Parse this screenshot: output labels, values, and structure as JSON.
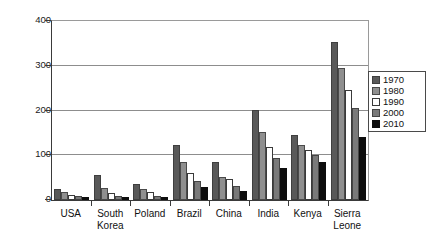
{
  "chart_data": {
    "type": "bar",
    "title": "",
    "xlabel": "",
    "ylabel": "",
    "ylim": [
      0,
      400
    ],
    "yticks": [
      0,
      100,
      200,
      300,
      400
    ],
    "grid": true,
    "legend_position": "right",
    "categories": [
      "USA",
      "South\nKorea",
      "Poland",
      "Brazil",
      "China",
      "India",
      "Kenya",
      "Sierra\nLeone"
    ],
    "series": [
      {
        "name": "1970",
        "color": "#595959",
        "values": [
          25,
          55,
          35,
          122,
          85,
          202,
          145,
          352
        ]
      },
      {
        "name": "1980",
        "color": "#8f8f8f",
        "values": [
          17,
          27,
          25,
          85,
          52,
          152,
          122,
          295
        ]
      },
      {
        "name": "1990",
        "color": "#ffffff",
        "values": [
          12,
          15,
          18,
          60,
          48,
          118,
          112,
          245
        ]
      },
      {
        "name": "2000",
        "color": "#7a7a7a",
        "values": [
          9,
          10,
          10,
          42,
          32,
          95,
          100,
          205
        ]
      },
      {
        "name": "2010",
        "color": "#0d0d0d",
        "values": [
          7,
          6,
          6,
          30,
          20,
          72,
          85,
          140
        ]
      }
    ]
  },
  "legend": {
    "items": [
      {
        "label": "1970"
      },
      {
        "label": "1980"
      },
      {
        "label": "1990"
      },
      {
        "label": "2000"
      },
      {
        "label": "2010"
      }
    ]
  },
  "caption": {
    "text": ""
  }
}
